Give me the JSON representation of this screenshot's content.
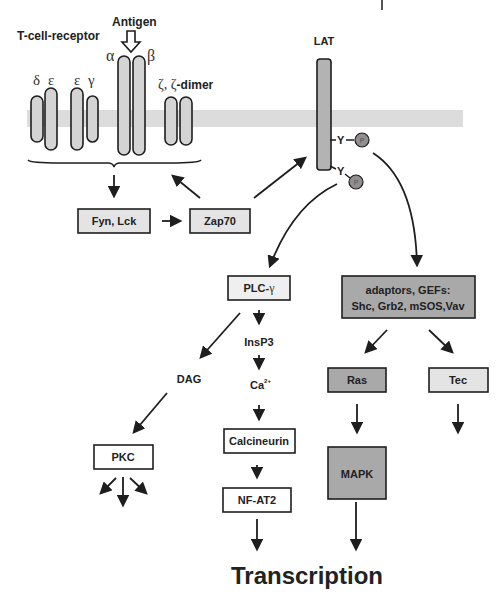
{
  "labels": {
    "tcr": "T-cell-receptor",
    "antigen": "Antigen",
    "delta": "δ",
    "epsilon1": "ε",
    "epsilon2": "ε",
    "gamma": "γ",
    "alpha": "α",
    "beta": "β",
    "zeta_prefix": "ζ, ζ",
    "zeta_suffix": "-dimer",
    "lat": "LAT",
    "y1": "Y",
    "y2": "Y",
    "p1": "P",
    "p2": "P",
    "dag": "DAG",
    "insp3": "InsP3",
    "ca": "Ca",
    "ca_sup": "2+",
    "transcription": "Transcription"
  },
  "boxes": {
    "fyn_lck": "Fyn, Lck",
    "zap70": "Zap70",
    "plc": "PLC-",
    "plc_greek": "γ",
    "adaptors_line1": "adaptors, GEFs:",
    "adaptors_line2": "Shc, Grb2, mSOS,Vav",
    "ras": "Ras",
    "tec": "Tec",
    "mapk": "MAPK",
    "pkc": "PKC",
    "calcineurin": "Calcineurin",
    "nfat2": "NF-AT2"
  },
  "colors": {
    "membrane": "#dcdcdc",
    "receptor_fill": "#d4d4d4",
    "lat_fill": "#b3b3b3",
    "light_box": "#e4e4e4",
    "dark_box": "#a9a9a9",
    "white_box": "#ffffff",
    "phospho": "#8f8f8f",
    "stroke": "#1e1e1e"
  }
}
